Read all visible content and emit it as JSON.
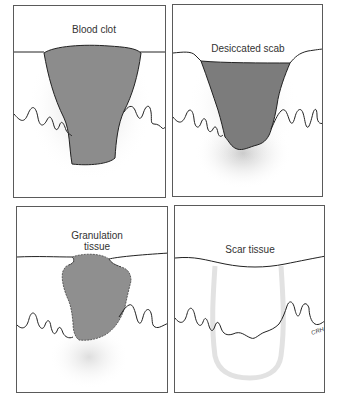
{
  "figure": {
    "panels": [
      {
        "id": "blood-clot",
        "label": "Blood clot",
        "stage": 1
      },
      {
        "id": "desiccated-scab",
        "label": "Desiccated scab",
        "stage": 2
      },
      {
        "id": "granulation-tissue",
        "label_line1": "Granulation",
        "label_line2": "tissue",
        "stage": 3
      },
      {
        "id": "scar-tissue",
        "label": "Scar tissue",
        "stage": 4
      }
    ],
    "signature": "CRH",
    "colors": {
      "wound_fill": "#8c8c8c",
      "outline": "#222222",
      "stipple": "#c8c8c8",
      "border": "#5a5a5a"
    }
  }
}
